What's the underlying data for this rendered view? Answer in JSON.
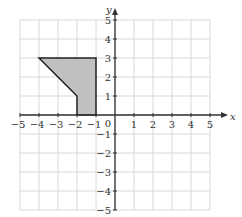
{
  "diagram": {
    "title": "",
    "x_axis_label": "x",
    "y_axis_label": "y",
    "x_range": [
      -5,
      5
    ],
    "y_range": [
      -5,
      5
    ],
    "grid": true,
    "origin_label": "0",
    "x_ticks": [
      "−5",
      "−4",
      "−3",
      "−2",
      "−1",
      "1",
      "2",
      "3",
      "4",
      "5"
    ],
    "y_ticks": [
      "5",
      "4",
      "3",
      "2",
      "1",
      "−1",
      "−2",
      "−3",
      "−4",
      "−5"
    ],
    "shape": {
      "type": "polygon",
      "vertices": [
        [
          -4,
          3
        ],
        [
          -1,
          3
        ],
        [
          -1,
          0
        ],
        [
          -2,
          0
        ],
        [
          -2,
          1
        ]
      ],
      "fill": "#c0c0c0",
      "stroke": "#222222"
    },
    "colors": {
      "grid": "#d8d8d8",
      "axis": "#333333"
    }
  }
}
